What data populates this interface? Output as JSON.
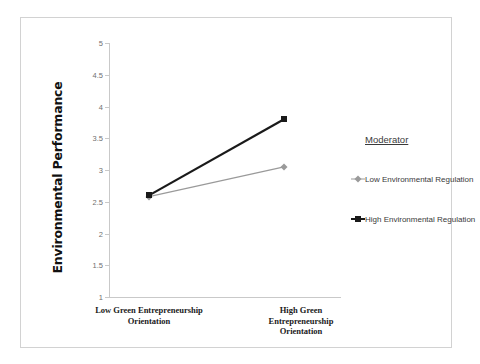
{
  "chart_data": {
    "type": "line",
    "title": "",
    "xlabel": "",
    "ylabel": "Environmental Performance",
    "categories": [
      "Low Green Entrepreneurship Orientation",
      "High Green Entrepreneurship Orientation"
    ],
    "category_lines": [
      [
        "Low Green Entrepreneurship",
        "Orientation"
      ],
      [
        "High Green",
        "Entrepreneurship",
        "Orientation"
      ]
    ],
    "series": [
      {
        "name": "Low Environmental Regulation",
        "values": [
          2.58,
          3.05
        ],
        "color": "#9a9a9a",
        "marker": "diamond",
        "line_width": 1.2
      },
      {
        "name": "High Environmental Regulation",
        "values": [
          2.6,
          3.8
        ],
        "color": "#1a1a1a",
        "marker": "square",
        "line_width": 2.2
      }
    ],
    "ylim": [
      1,
      5
    ],
    "ytick_step": 0.5,
    "yticks": [
      "5",
      "4.5",
      "4",
      "3.5",
      "3",
      "2.5",
      "2",
      "1.5",
      "1"
    ],
    "grid": false,
    "legend_position": "right"
  },
  "legend": {
    "title": "Moderator",
    "entries": [
      "Low Environmental Regulation",
      "High Environmental Regulation"
    ]
  },
  "axis": {
    "y_title": "Environmental Performance"
  }
}
